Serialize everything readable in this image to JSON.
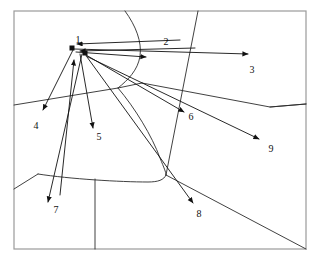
{
  "figure": {
    "type": "diagram",
    "width": 321,
    "height": 261,
    "background_color": "#ffffff",
    "border_color": "#9a9a9a",
    "line_color": "#2b2b2b",
    "flow_color": "#111111",
    "label_color": "#111111"
  },
  "labels": [
    {
      "id": "label-1",
      "text": "1",
      "x": 78,
      "y": 41
    },
    {
      "id": "label-2",
      "text": "2",
      "x": 166,
      "y": 43
    },
    {
      "id": "label-3",
      "text": "3",
      "x": 252,
      "y": 71
    },
    {
      "id": "label-4",
      "text": "4",
      "x": 36,
      "y": 127
    },
    {
      "id": "label-5",
      "text": "5",
      "x": 99,
      "y": 138
    },
    {
      "id": "label-6",
      "text": "6",
      "x": 191,
      "y": 118
    },
    {
      "id": "label-7",
      "text": "7",
      "x": 56,
      "y": 211
    },
    {
      "id": "label-8",
      "text": "8",
      "x": 199,
      "y": 215
    },
    {
      "id": "label-9",
      "text": "9",
      "x": 271,
      "y": 150
    }
  ],
  "hubs": [
    {
      "id": "hub-a",
      "x": 72,
      "y": 48,
      "size": 5
    },
    {
      "id": "hub-b",
      "x": 85,
      "y": 53,
      "size": 5
    }
  ],
  "flows": [
    {
      "id": "flow-in-2a",
      "from_x": 180,
      "from_y": 40,
      "to_x": 77,
      "to_y": 44,
      "direction": "inbound",
      "target": "1"
    },
    {
      "id": "flow-in-2b",
      "from_x": 195,
      "from_y": 48,
      "to_x": 80,
      "to_y": 51,
      "direction": "inbound",
      "target": "1"
    },
    {
      "id": "flow-out-3",
      "from_x": 74,
      "from_y": 49,
      "to_x": 248,
      "to_y": 54,
      "direction": "outbound",
      "target": "3"
    },
    {
      "id": "flow-out-2m",
      "from_x": 76,
      "from_y": 52,
      "to_x": 146,
      "to_y": 57,
      "direction": "outbound",
      "target": "2"
    },
    {
      "id": "flow-out-6",
      "from_x": 86,
      "from_y": 55,
      "to_x": 184,
      "to_y": 112,
      "direction": "outbound",
      "target": "6"
    },
    {
      "id": "flow-out-9",
      "from_x": 86,
      "from_y": 56,
      "to_x": 259,
      "to_y": 139,
      "direction": "outbound",
      "target": "9"
    },
    {
      "id": "flow-out-8",
      "from_x": 87,
      "from_y": 57,
      "to_x": 193,
      "to_y": 203,
      "direction": "outbound",
      "target": "8"
    },
    {
      "id": "flow-out-4",
      "from_x": 73,
      "from_y": 50,
      "to_x": 43,
      "to_y": 110,
      "direction": "outbound",
      "target": "4"
    },
    {
      "id": "flow-out-5",
      "from_x": 80,
      "from_y": 54,
      "to_x": 93,
      "to_y": 128,
      "direction": "outbound",
      "target": "5"
    },
    {
      "id": "flow-out-7",
      "from_x": 82,
      "from_y": 54,
      "to_x": 48,
      "to_y": 202,
      "direction": "outbound",
      "target": "7"
    },
    {
      "id": "flow-in-4",
      "from_x": 60,
      "from_y": 195,
      "to_x": 74,
      "to_y": 60,
      "direction": "inbound",
      "target": "1"
    }
  ],
  "region_paths": [
    {
      "id": "path-upper-curve",
      "d": "M 125 11 C 136 26 142 42 140 56 C 138 70 128 80 118 88"
    },
    {
      "id": "path-mid-curve",
      "d": "M 118 88 C 135 108 152 136 160 158 C 164 168 166 172 166 175"
    },
    {
      "id": "path-bottom-curve",
      "d": "M 166 175 C 164 180 158 182 148 182 C 120 182 70 179 38 174"
    },
    {
      "id": "path-left-band",
      "d": "M 14 105 L 118 88 L 142 83"
    },
    {
      "id": "path-right-band",
      "d": "M 142 83 L 270 107 L 306 104"
    },
    {
      "id": "path-diagonal-ne",
      "d": "M 198 11 L 166 175"
    },
    {
      "id": "path-diagonal-se",
      "d": "M 166 175 L 306 249"
    },
    {
      "id": "path-spur-right",
      "d": "M 270 107 L 306 104"
    },
    {
      "id": "path-vertical",
      "d": "M 95 179 L 95 249"
    },
    {
      "id": "path-bottom-left",
      "d": "M 38 174 L 14 189"
    }
  ],
  "border": {
    "x": 14,
    "y": 11,
    "width": 292,
    "height": 238
  }
}
